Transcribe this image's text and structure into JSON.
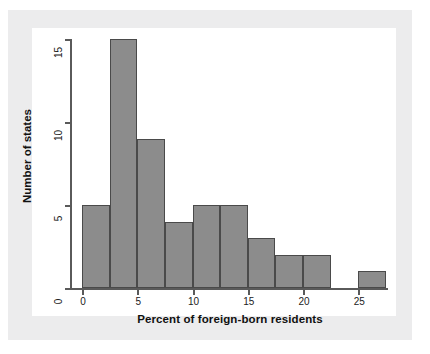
{
  "chart_data": {
    "type": "bar",
    "title": "",
    "subtitle": "",
    "xlabel": "Percent of foreign-born residents",
    "ylabel": "Number of states",
    "xlim": [
      -1.5,
      29
    ],
    "ylim": [
      0,
      15.8
    ],
    "bin_width": 2.5,
    "grid": false,
    "legend": null,
    "xticks": [
      "0",
      "5",
      "10",
      "15",
      "20",
      "25"
    ],
    "xtick_values": [
      0,
      5,
      10,
      15,
      20,
      25
    ],
    "yticks": [
      "0",
      "5",
      "10",
      "15"
    ],
    "ytick_values": [
      0,
      5,
      10,
      15
    ],
    "categories": [
      "0.0-2.5",
      "2.5-5.0",
      "5.0-7.5",
      "7.5-10.0",
      "10.0-12.5",
      "12.5-15.0",
      "15.0-17.5",
      "17.5-20.0",
      "20.0-22.5",
      "22.5-25.0",
      "25.0-27.5"
    ],
    "bin_starts": [
      0,
      2.5,
      5,
      7.5,
      10,
      12.5,
      15,
      17.5,
      20,
      22.5,
      25
    ],
    "values": [
      5,
      15,
      9,
      4,
      5,
      5,
      3,
      2,
      2,
      0,
      1
    ],
    "bar_color": "#8c8c8c",
    "bar_edge_color": "#4a4a4a",
    "axis_color": "#5a5a5a",
    "plot_background": "#ffffff",
    "page_background": "#ececed"
  }
}
